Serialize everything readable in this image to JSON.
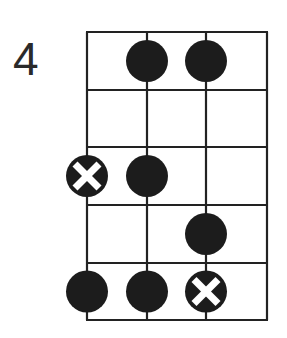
{
  "diagram": {
    "type": "fretboard-scale-pattern",
    "start_fret_label": "4",
    "strings": 4,
    "frets": 5,
    "grid": {
      "x_lines": [
        87,
        147,
        206,
        267
      ],
      "y_lines": [
        32,
        90,
        147,
        205,
        263,
        320
      ],
      "line_color": "#222222"
    },
    "dot_radius": 21,
    "dot_color": "#1c1c1c",
    "root_mark_color": "#ffffff",
    "notes": [
      {
        "string": 2,
        "fret": 1,
        "root": false
      },
      {
        "string": 3,
        "fret": 1,
        "root": false
      },
      {
        "string": 1,
        "fret": 3,
        "root": true
      },
      {
        "string": 2,
        "fret": 3,
        "root": false
      },
      {
        "string": 3,
        "fret": 4,
        "root": false
      },
      {
        "string": 1,
        "fret": 5,
        "root": false
      },
      {
        "string": 2,
        "fret": 5,
        "root": false
      },
      {
        "string": 3,
        "fret": 5,
        "root": true
      }
    ]
  }
}
